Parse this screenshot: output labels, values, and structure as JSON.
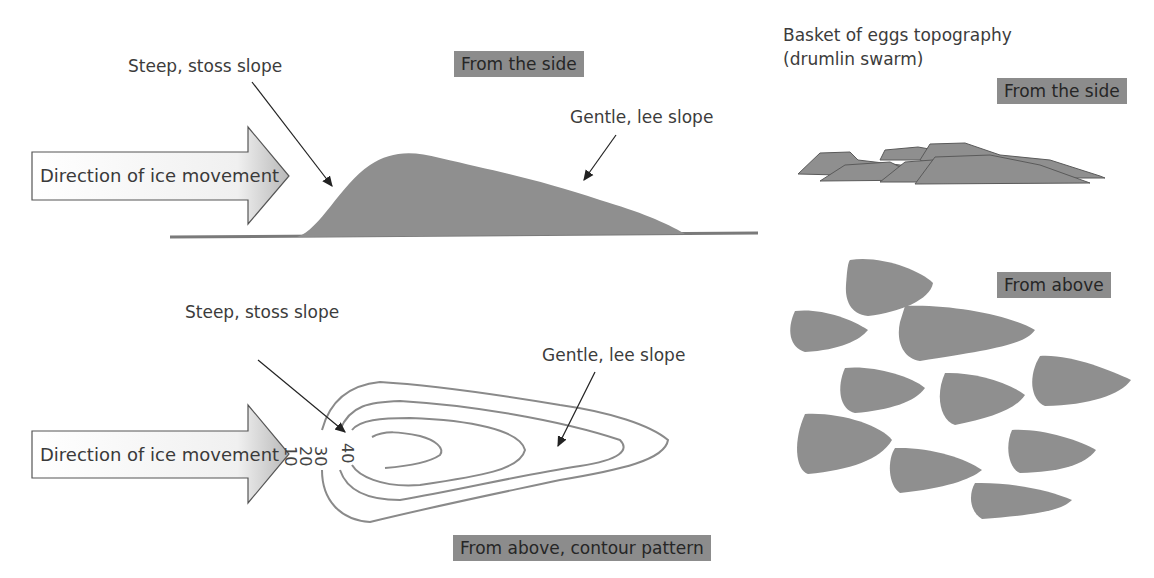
{
  "side_view": {
    "tag": "From the side",
    "stoss_label": "Steep, stoss slope",
    "lee_label": "Gentle, lee slope",
    "arrow_label": "Direction of ice movement"
  },
  "plan_view": {
    "tag": "From above, contour pattern",
    "stoss_label": "Steep, stoss slope",
    "lee_label": "Gentle, lee slope",
    "arrow_label": "Direction of ice movement",
    "contours": [
      "10",
      "20",
      "30",
      "40"
    ]
  },
  "swarm": {
    "title_line1": "Basket of eggs topography",
    "title_line2": "(drumlin swarm)",
    "side_tag": "From the side",
    "above_tag": "From above"
  },
  "colors": {
    "fill": "#8f8f8f",
    "tag_bg": "#8c8c8c",
    "contour": "#8a8a8a"
  }
}
